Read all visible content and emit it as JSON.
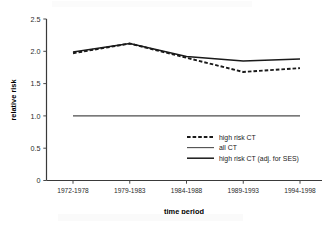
{
  "chart_data": {
    "type": "line",
    "title": "",
    "xlabel": "time period",
    "ylabel": "relative risk",
    "categories": [
      "1972-1978",
      "1979-1983",
      "1984-1988",
      "1989-1993",
      "1994-1998"
    ],
    "yticks": [
      "0",
      "0.5",
      "1.0",
      "1.5",
      "2.0",
      "2.5"
    ],
    "ytick_values": [
      0,
      0.5,
      1.0,
      1.5,
      2.0,
      2.5
    ],
    "ylim": [
      0,
      2.5
    ],
    "grid": false,
    "legend_position": "center-right",
    "series": [
      {
        "name": "high risk CT",
        "style": "dashed",
        "color": "#1a1a1a",
        "values": [
          1.97,
          2.12,
          1.9,
          1.68,
          1.74
        ]
      },
      {
        "name": "all CT",
        "style": "solid-thin",
        "color": "#4d4d4d",
        "values": [
          1.0,
          1.0,
          1.0,
          1.0,
          1.0
        ]
      },
      {
        "name": "high risk CT (adj. for SES)",
        "style": "solid-thick",
        "color": "#1a1a1a",
        "values": [
          1.99,
          2.12,
          1.92,
          1.85,
          1.88
        ]
      }
    ]
  },
  "legend": {
    "items": [
      {
        "label": "high risk CT"
      },
      {
        "label": "all CT"
      },
      {
        "label": "high risk CT (adj. for SES)"
      }
    ]
  }
}
